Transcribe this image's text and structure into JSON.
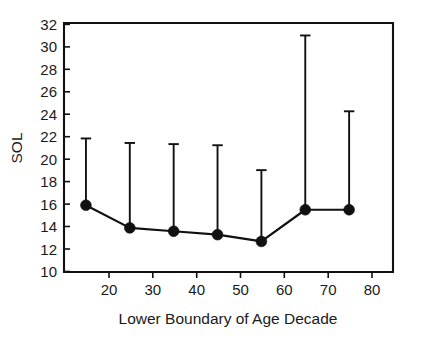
{
  "chart_data": {
    "type": "line",
    "title": "",
    "subtitle": "",
    "xlabel": "Lower Boundary of Age Decade",
    "ylabel": "SOL",
    "x": [
      20,
      30,
      40,
      50,
      60,
      70,
      80
    ],
    "values": [
      15.9,
      13.9,
      13.6,
      13.3,
      12.7,
      15.5,
      15.5
    ],
    "error_upper": [
      21.8,
      21.4,
      21.3,
      21.2,
      19.0,
      30.9,
      24.2
    ],
    "series": [
      {
        "name": "SOL",
        "values": [
          15.9,
          13.9,
          13.6,
          13.3,
          12.7,
          15.5,
          15.5
        ],
        "error_upper": [
          21.8,
          21.4,
          21.3,
          21.2,
          19.0,
          30.9,
          24.2
        ]
      }
    ],
    "xlim": [
      15,
      90
    ],
    "ylim": [
      10,
      32
    ],
    "xticks": [
      20,
      30,
      40,
      50,
      60,
      70,
      80
    ],
    "yticks": [
      10,
      12,
      14,
      16,
      18,
      20,
      22,
      24,
      26,
      28,
      30,
      32
    ],
    "xtick_labels": [
      "20",
      "30",
      "40",
      "50",
      "60",
      "70",
      "80"
    ],
    "ytick_labels": [
      "10",
      "12",
      "14",
      "16",
      "18",
      "20",
      "22",
      "24",
      "26",
      "28",
      "30",
      "32"
    ],
    "grid": false,
    "legend": false,
    "legend_position": "none",
    "marker_style": "filled-circle",
    "errorbar_style": "upper-only-with-cap",
    "colors": {
      "line": "#111111",
      "marker": "#111111",
      "errorbar": "#111111",
      "axis": "#111111",
      "background": "#ffffff",
      "text": "#1a1a1a"
    }
  }
}
